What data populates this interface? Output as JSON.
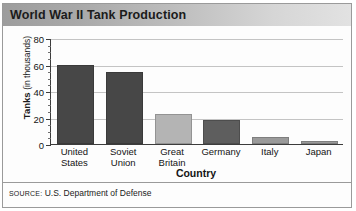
{
  "title": "World War II Tank Production",
  "source": {
    "label": "SOURCE:",
    "text": "U.S. Department of Defense"
  },
  "chart_data": {
    "type": "bar",
    "title": "World War II Tank Production",
    "xlabel": "Country",
    "ylabel": "Tanks (in thousands)",
    "ylabel_main": "Tanks",
    "ylabel_unit": "(in thousands)",
    "categories": [
      "United States",
      "Soviet Union",
      "Great Britain",
      "Germany",
      "Italy",
      "Japan"
    ],
    "category_lines": [
      [
        "United",
        "States"
      ],
      [
        "Soviet",
        "Union"
      ],
      [
        "Great",
        "Britain"
      ],
      [
        "Germany",
        ""
      ],
      [
        "Italy",
        ""
      ],
      [
        "Japan",
        ""
      ]
    ],
    "values": [
      60,
      54,
      23,
      18,
      5,
      2
    ],
    "bar_colors": [
      "#474747",
      "#474747",
      "#b4b4b4",
      "#5e5e5e",
      "#9a9a9a",
      "#9a9a9a"
    ],
    "ylim": [
      0,
      80
    ],
    "yticks": [
      0,
      20,
      40,
      60,
      80
    ],
    "ytick_labels": [
      "0",
      "20",
      "40",
      "60",
      "80"
    ],
    "minor_tick_step": 5,
    "grid": true,
    "grid_axis": "y",
    "legend": false
  },
  "colors": {
    "title_bar_start": "#9d9d9d",
    "title_bar_end": "#e2e2e2",
    "frame": "#9a9a9a",
    "axis": "#3c3c3c",
    "gridline": "#c4c4c4",
    "text": "#141414"
  }
}
